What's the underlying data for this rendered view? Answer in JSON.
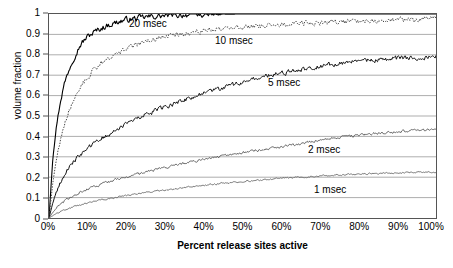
{
  "chart_data": {
    "type": "line",
    "title": "",
    "xlabel": "Percent release sites active",
    "ylabel": "volume fraction",
    "xlim": [
      0,
      100
    ],
    "ylim": [
      0,
      1
    ],
    "grid": "horizontal",
    "legend_position": "inline-annotations",
    "xticks": [
      "0%",
      "10%",
      "20%",
      "30%",
      "40%",
      "50%",
      "60%",
      "70%",
      "80%",
      "90%",
      "100%"
    ],
    "xtick_values": [
      0,
      10,
      20,
      30,
      40,
      50,
      60,
      70,
      80,
      90,
      100
    ],
    "yticks": [
      "0",
      "0.1",
      "0.2",
      "0.3",
      "0.4",
      "0.5",
      "0.6",
      "0.7",
      "0.8",
      "0.9",
      "1"
    ],
    "ytick_values": [
      0,
      0.1,
      0.2,
      0.3,
      0.4,
      0.5,
      0.6,
      0.7,
      0.8,
      0.9,
      1
    ],
    "x": [
      0,
      1,
      2,
      3,
      4,
      5,
      6,
      7,
      8,
      9,
      10,
      12,
      14,
      16,
      18,
      20,
      25,
      30,
      35,
      40,
      45,
      50,
      55,
      60,
      65,
      70,
      75,
      80,
      85,
      90,
      95,
      100
    ],
    "series": [
      {
        "name": "20 msec",
        "style": "solid",
        "color": "#000000",
        "width": 1.1,
        "noise": 0.022,
        "label": "20 msec",
        "values": [
          0.0,
          0.3,
          0.46,
          0.58,
          0.66,
          0.72,
          0.77,
          0.81,
          0.845,
          0.87,
          0.89,
          0.915,
          0.935,
          0.95,
          0.962,
          0.972,
          0.985,
          0.992,
          0.996,
          0.998,
          0.999,
          1.0,
          1.0,
          1.0,
          1.0,
          1.0,
          1.0,
          1.0,
          1.0,
          1.0,
          1.0,
          1.0
        ]
      },
      {
        "name": "10 msec",
        "style": "dotted",
        "color": "#444444",
        "width": 1.0,
        "noise": 0.02,
        "label": "10 msec",
        "values": [
          0.0,
          0.175,
          0.3,
          0.39,
          0.46,
          0.52,
          0.565,
          0.605,
          0.64,
          0.665,
          0.69,
          0.735,
          0.765,
          0.79,
          0.81,
          0.83,
          0.865,
          0.89,
          0.905,
          0.918,
          0.928,
          0.936,
          0.943,
          0.949,
          0.954,
          0.958,
          0.962,
          0.966,
          0.969,
          0.972,
          0.974,
          0.976
        ]
      },
      {
        "name": "5 msec",
        "style": "solid",
        "color": "#111111",
        "width": 1.0,
        "noise": 0.018,
        "label": "5 msec",
        "values": [
          0.0,
          0.075,
          0.13,
          0.175,
          0.21,
          0.24,
          0.265,
          0.29,
          0.31,
          0.325,
          0.34,
          0.37,
          0.395,
          0.418,
          0.44,
          0.46,
          0.505,
          0.545,
          0.58,
          0.61,
          0.64,
          0.665,
          0.69,
          0.71,
          0.728,
          0.745,
          0.758,
          0.768,
          0.776,
          0.783,
          0.788,
          0.792
        ]
      },
      {
        "name": "2 msec",
        "style": "solid",
        "color": "#555555",
        "width": 0.9,
        "noise": 0.01,
        "label": "2 msec",
        "values": [
          0.0,
          0.028,
          0.05,
          0.068,
          0.083,
          0.095,
          0.106,
          0.116,
          0.125,
          0.133,
          0.141,
          0.155,
          0.168,
          0.18,
          0.19,
          0.2,
          0.225,
          0.248,
          0.268,
          0.287,
          0.305,
          0.32,
          0.335,
          0.35,
          0.365,
          0.382,
          0.395,
          0.405,
          0.415,
          0.423,
          0.429,
          0.434
        ]
      },
      {
        "name": "1 msec",
        "style": "solid",
        "color": "#666666",
        "width": 0.9,
        "noise": 0.006,
        "label": "1 msec",
        "values": [
          0.0,
          0.012,
          0.022,
          0.031,
          0.039,
          0.046,
          0.052,
          0.058,
          0.063,
          0.068,
          0.073,
          0.082,
          0.09,
          0.097,
          0.104,
          0.11,
          0.124,
          0.137,
          0.149,
          0.16,
          0.17,
          0.179,
          0.187,
          0.194,
          0.2,
          0.206,
          0.211,
          0.215,
          0.219,
          0.222,
          0.225,
          0.227
        ]
      }
    ],
    "annotations": [
      {
        "text": "20 msec",
        "left": 129,
        "top": 18
      },
      {
        "text": "10 msec",
        "left": 215,
        "top": 35
      },
      {
        "text": "5 msec",
        "left": 268,
        "top": 77
      },
      {
        "text": "2 msec",
        "left": 308,
        "top": 144
      },
      {
        "text": "1 msec",
        "left": 314,
        "top": 184
      }
    ]
  },
  "style": {
    "axis_color": "#555555",
    "grid_color": "#888888",
    "background": "#ffffff",
    "text_color": "#000000"
  }
}
